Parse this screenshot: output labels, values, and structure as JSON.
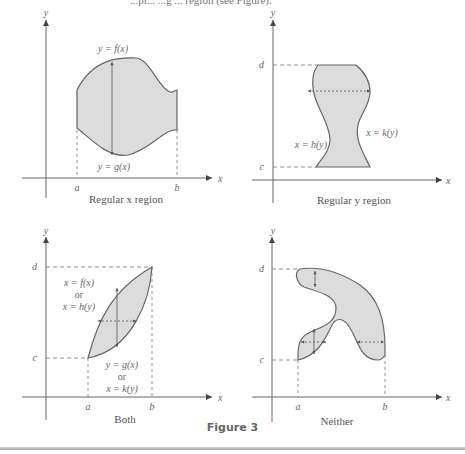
{
  "top_text_fragment": "...pi... ...g ... region (see Figure).",
  "figure_label": "Figure 3",
  "panels": [
    {
      "caption": "Regular x region",
      "axis_x": "x",
      "axis_y": "y",
      "ticks_x": [
        "a",
        "b"
      ],
      "ticks_y": [],
      "curve_labels": [
        "y = f(x)",
        "y = g(x)"
      ]
    },
    {
      "caption": "Regular y region",
      "axis_x": "x",
      "axis_y": "y",
      "ticks_x": [],
      "ticks_y": [
        "d",
        "c"
      ],
      "curve_labels": [
        "x = h(y)",
        "x = k(y)"
      ]
    },
    {
      "caption": "Both",
      "axis_x": "x",
      "axis_y": "y",
      "ticks_x": [
        "a",
        "b"
      ],
      "ticks_y": [
        "d",
        "c"
      ],
      "curve_labels": [
        "x = f(x)",
        "or",
        "x = h(y)",
        "y = g(x)",
        "or",
        "x = k(y)"
      ]
    },
    {
      "caption": "Neither",
      "axis_x": "x",
      "axis_y": "y",
      "ticks_x": [
        "a",
        "b"
      ],
      "ticks_y": [
        "d",
        "c"
      ],
      "curve_labels": []
    }
  ],
  "colors": {
    "region_fill": "#dcdcdc",
    "outline": "#666666",
    "axis": "#555555",
    "dash": "#777777"
  }
}
